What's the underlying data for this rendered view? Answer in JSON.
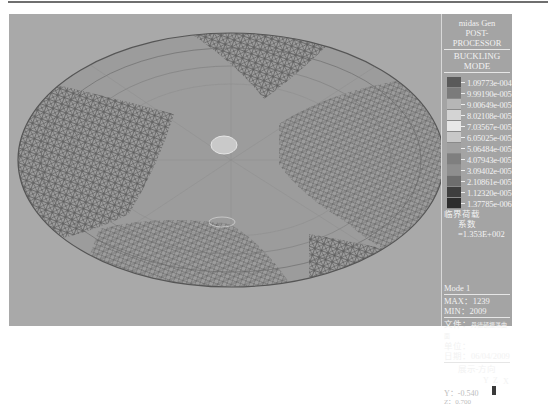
{
  "window": {
    "app_name": "midas Gen",
    "module": "POST-PROCESSOR",
    "result_type": "BUCKLING MODE"
  },
  "legend": {
    "entries": [
      {
        "value": "1.09773e-004",
        "color": "#5a5a5a"
      },
      {
        "value": "9.99190e-005",
        "color": "#7b7b7b"
      },
      {
        "value": "9.00649e-005",
        "color": "#b6b6b6"
      },
      {
        "value": "8.02108e-005",
        "color": "#d4d4d4"
      },
      {
        "value": "7.03567e-005",
        "color": "#e8e8e8"
      },
      {
        "value": "6.05025e-005",
        "color": "#c8c8c8"
      },
      {
        "value": "5.06484e-005",
        "color": "#a0a0a0"
      },
      {
        "value": "4.07943e-005",
        "color": "#7f7f7f"
      },
      {
        "value": "3.09402e-005",
        "color": "#8e8e8e"
      },
      {
        "value": "2.10861e-005",
        "color": "#6e6e6e"
      },
      {
        "value": "1.12320e-005",
        "color": "#3e3e3e"
      },
      {
        "value": "1.37785e-006",
        "color": "#2c2c2c"
      }
    ]
  },
  "critical_load": {
    "label": "临界荷载",
    "factor_label": "系数=1.353E+002"
  },
  "mode_info": {
    "mode": "Mode 1",
    "max": "MAX：1239",
    "min": "MIN：2009"
  },
  "file_info": {
    "file_label": "文件：",
    "file_name": "丹德顿振荡曲面",
    "unit_label": "单位：",
    "date_label": "日期：",
    "date_value": "06/04/2009"
  },
  "view_direction": {
    "label": "展示-方向",
    "axes": [
      "Y",
      "Z",
      "X"
    ],
    "y_value": "Y：-0.540",
    "z_value": "Z：0.700"
  },
  "colors": {
    "viewport_bg": "#a9a9a9",
    "panel_bg": "#a4a4a4",
    "mesh": "#5e5e5e"
  }
}
